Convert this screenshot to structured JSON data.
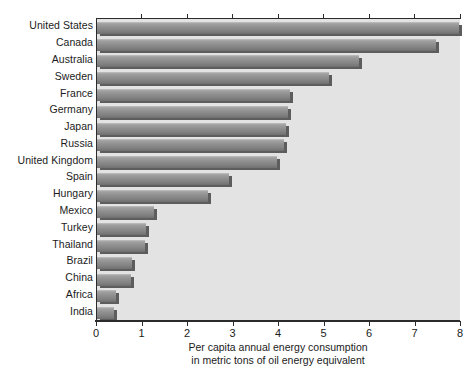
{
  "chart_data": {
    "type": "bar",
    "orientation": "horizontal",
    "title": "",
    "subtitle": "",
    "xlabel": "Per capita annual energy consumption in metric tons of oil energy equivalent",
    "xlabel_line1": "Per capita annual energy consumption",
    "xlabel_line2": "in metric tons of oil energy equivalent",
    "ylabel": "",
    "xlim": [
      0,
      8
    ],
    "xticks": [
      0,
      1,
      2,
      3,
      4,
      5,
      6,
      7,
      8
    ],
    "xtick_labels": [
      "0",
      "1",
      "2",
      "3",
      "4",
      "5",
      "6",
      "7",
      "8"
    ],
    "grid": false,
    "legend": false,
    "categories": [
      "United States",
      "Canada",
      "Australia",
      "Sweden",
      "France",
      "Germany",
      "Japan",
      "Russia",
      "United Kingdom",
      "Spain",
      "Hungary",
      "Mexico",
      "Turkey",
      "Thailand",
      "Brazil",
      "China",
      "Africa",
      "India"
    ],
    "values": [
      7.95,
      7.45,
      5.75,
      5.1,
      4.25,
      4.2,
      4.15,
      4.1,
      3.95,
      2.9,
      2.45,
      1.25,
      1.08,
      1.05,
      0.78,
      0.75,
      0.42,
      0.38
    ],
    "bar_color": "#8e8e8e",
    "bar_shadow_color": "#5d5d5d",
    "plot_background": "#e3e3e3",
    "axis_color": "#2b2b2b",
    "text_color": "#1b1b1b"
  }
}
